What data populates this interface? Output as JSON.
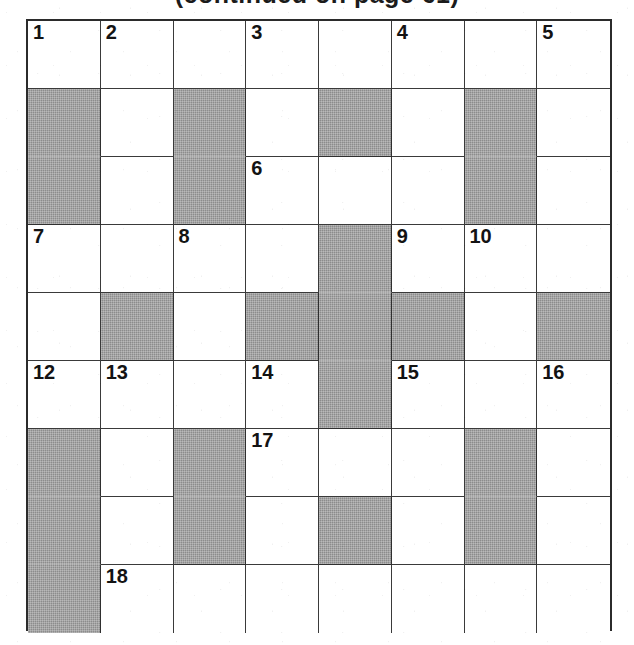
{
  "caption": {
    "text": "(continued on page 61)"
  },
  "puzzle": {
    "kind": "crossword-grid",
    "rows": 9,
    "cols": 8,
    "cell_fill_color": "#ffffff",
    "blocked_fill_color": "#8c8c8c",
    "grid_line_color": "#3a3a3a",
    "border_color": "#2b2b2b",
    "number_color": "#131313",
    "clue_numbers_in_order": [
      1,
      2,
      3,
      4,
      5,
      6,
      7,
      8,
      9,
      10,
      11,
      12,
      13,
      14,
      15,
      16,
      17,
      18
    ],
    "grid": [
      [
        {
          "blocked": false,
          "number": "1"
        },
        {
          "blocked": false,
          "number": "2"
        },
        {
          "blocked": false,
          "number": ""
        },
        {
          "blocked": false,
          "number": "3"
        },
        {
          "blocked": false,
          "number": ""
        },
        {
          "blocked": false,
          "number": "4"
        },
        {
          "blocked": false,
          "number": ""
        },
        {
          "blocked": false,
          "number": "5"
        },
        {
          "blocked": true,
          "number": ""
        }
      ],
      [
        {
          "blocked": true,
          "number": ""
        },
        {
          "blocked": false,
          "number": ""
        },
        {
          "blocked": true,
          "number": ""
        },
        {
          "blocked": false,
          "number": ""
        },
        {
          "blocked": true,
          "number": ""
        },
        {
          "blocked": false,
          "number": ""
        },
        {
          "blocked": true,
          "number": ""
        },
        {
          "blocked": false,
          "number": ""
        },
        {
          "blocked": true,
          "number": ""
        }
      ],
      [
        {
          "blocked": true,
          "number": ""
        },
        {
          "blocked": false,
          "number": ""
        },
        {
          "blocked": true,
          "number": ""
        },
        {
          "blocked": false,
          "number": "6"
        },
        {
          "blocked": false,
          "number": ""
        },
        {
          "blocked": false,
          "number": ""
        },
        {
          "blocked": true,
          "number": ""
        },
        {
          "blocked": false,
          "number": ""
        },
        {
          "blocked": true,
          "number": ""
        }
      ],
      [
        {
          "blocked": false,
          "number": "7"
        },
        {
          "blocked": false,
          "number": ""
        },
        {
          "blocked": false,
          "number": "8"
        },
        {
          "blocked": false,
          "number": ""
        },
        {
          "blocked": true,
          "number": ""
        },
        {
          "blocked": false,
          "number": "9"
        },
        {
          "blocked": false,
          "number": "10"
        },
        {
          "blocked": false,
          "number": ""
        },
        {
          "blocked": false,
          "number": "11"
        }
      ],
      [
        {
          "blocked": false,
          "number": ""
        },
        {
          "blocked": true,
          "number": ""
        },
        {
          "blocked": false,
          "number": ""
        },
        {
          "blocked": true,
          "number": ""
        },
        {
          "blocked": true,
          "number": ""
        },
        {
          "blocked": true,
          "number": ""
        },
        {
          "blocked": false,
          "number": ""
        },
        {
          "blocked": true,
          "number": ""
        },
        {
          "blocked": false,
          "number": ""
        }
      ],
      [
        {
          "blocked": false,
          "number": "12"
        },
        {
          "blocked": false,
          "number": "13"
        },
        {
          "blocked": false,
          "number": ""
        },
        {
          "blocked": false,
          "number": "14"
        },
        {
          "blocked": true,
          "number": ""
        },
        {
          "blocked": false,
          "number": "15"
        },
        {
          "blocked": false,
          "number": ""
        },
        {
          "blocked": false,
          "number": "16"
        },
        {
          "blocked": false,
          "number": ""
        }
      ],
      [
        {
          "blocked": true,
          "number": ""
        },
        {
          "blocked": false,
          "number": ""
        },
        {
          "blocked": true,
          "number": ""
        },
        {
          "blocked": false,
          "number": "17"
        },
        {
          "blocked": false,
          "number": ""
        },
        {
          "blocked": false,
          "number": ""
        },
        {
          "blocked": true,
          "number": ""
        },
        {
          "blocked": false,
          "number": ""
        },
        {
          "blocked": true,
          "number": ""
        }
      ],
      [
        {
          "blocked": true,
          "number": ""
        },
        {
          "blocked": false,
          "number": ""
        },
        {
          "blocked": true,
          "number": ""
        },
        {
          "blocked": false,
          "number": ""
        },
        {
          "blocked": true,
          "number": ""
        },
        {
          "blocked": false,
          "number": ""
        },
        {
          "blocked": true,
          "number": ""
        },
        {
          "blocked": false,
          "number": ""
        },
        {
          "blocked": true,
          "number": ""
        }
      ],
      [
        {
          "blocked": true,
          "number": ""
        },
        {
          "blocked": false,
          "number": "18"
        },
        {
          "blocked": false,
          "number": ""
        },
        {
          "blocked": false,
          "number": ""
        },
        {
          "blocked": false,
          "number": ""
        },
        {
          "blocked": false,
          "number": ""
        },
        {
          "blocked": false,
          "number": ""
        },
        {
          "blocked": false,
          "number": ""
        },
        {
          "blocked": false,
          "number": ""
        }
      ]
    ]
  }
}
